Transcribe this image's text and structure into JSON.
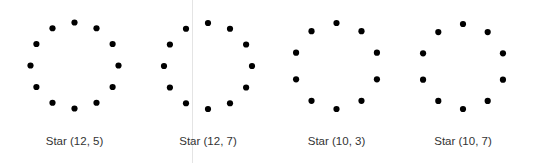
{
  "figure": {
    "dot_color": "#000000",
    "dot_radius": 3.1,
    "label_color": "#333333",
    "divider_color": "#e4e4e4",
    "divider_x": 191.5
  },
  "stars": [
    {
      "label": "Star (12, 5)",
      "n": 12,
      "k": 5,
      "cx": 74.5,
      "cy": 65.5,
      "rx": 44,
      "ry": 43,
      "start_angle_deg": -90
    },
    {
      "label": "Star (12, 7)",
      "n": 12,
      "k": 7,
      "cx": 208,
      "cy": 66,
      "rx": 44,
      "ry": 43,
      "start_angle_deg": -90
    },
    {
      "label": "Star (10, 3)",
      "n": 10,
      "k": 3,
      "cx": 336.5,
      "cy": 66,
      "rx": 42.5,
      "ry": 43,
      "start_angle_deg": -90
    },
    {
      "label": "Star (10, 7)",
      "n": 10,
      "k": 7,
      "cx": 463,
      "cy": 66.5,
      "rx": 42,
      "ry": 42.5,
      "start_angle_deg": -90
    }
  ]
}
